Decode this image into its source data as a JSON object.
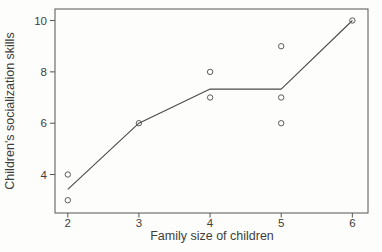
{
  "figure": {
    "background": "#fdfdfb"
  },
  "chart_data": {
    "type": "scatter",
    "title": "",
    "xlabel": "Family size of children",
    "ylabel": "Children's socialization skills",
    "xlim": [
      1.82,
      6.22
    ],
    "ylim": [
      2.5,
      10.45
    ],
    "xticks": [
      2,
      3,
      4,
      5,
      6
    ],
    "yticks": [
      4,
      6,
      8,
      10
    ],
    "grid": false,
    "legend": null,
    "marker": "open-circle",
    "marker_radius": 2.7,
    "colors": {
      "box_stroke": "#555555",
      "tick_stroke": "#555555",
      "marker_stroke": "#5a5a5a",
      "line_stroke": "#4a4a4a",
      "text": "#3d3d3d"
    },
    "points": [
      {
        "x": 2,
        "y": 4
      },
      {
        "x": 2,
        "y": 3
      },
      {
        "x": 3,
        "y": 6
      },
      {
        "x": 4,
        "y": 8
      },
      {
        "x": 4,
        "y": 7
      },
      {
        "x": 5,
        "y": 9
      },
      {
        "x": 5,
        "y": 7
      },
      {
        "x": 5,
        "y": 6
      },
      {
        "x": 6,
        "y": 10
      }
    ],
    "trend_line": [
      {
        "x": 2,
        "y": 3.42
      },
      {
        "x": 3,
        "y": 6.0
      },
      {
        "x": 4,
        "y": 7.33
      },
      {
        "x": 5,
        "y": 7.33
      },
      {
        "x": 6,
        "y": 10.0
      }
    ]
  }
}
